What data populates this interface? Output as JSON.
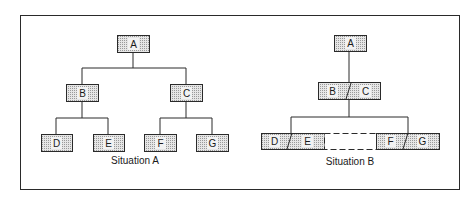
{
  "diagram": {
    "type": "org-chart-comparison",
    "colors": {
      "line": "#2a2a2a",
      "box_fill": "#cfcfcf",
      "label_bg": "#f2f2f2"
    },
    "situation_a": {
      "caption": "Situation A",
      "nodes": [
        {
          "id": "A",
          "label": "A"
        },
        {
          "id": "B",
          "label": "B"
        },
        {
          "id": "C",
          "label": "C"
        },
        {
          "id": "D",
          "label": "D"
        },
        {
          "id": "E",
          "label": "E"
        },
        {
          "id": "F",
          "label": "F"
        },
        {
          "id": "G",
          "label": "G"
        }
      ],
      "edges": [
        [
          "A",
          "B"
        ],
        [
          "A",
          "C"
        ],
        [
          "B",
          "D"
        ],
        [
          "B",
          "E"
        ],
        [
          "C",
          "F"
        ],
        [
          "C",
          "G"
        ]
      ]
    },
    "situation_b": {
      "caption": "Situation B",
      "nodes": [
        {
          "id": "A",
          "label": "A"
        },
        {
          "id": "BC",
          "labels": [
            "B",
            "C"
          ]
        },
        {
          "id": "DE",
          "labels": [
            "D",
            "E"
          ]
        },
        {
          "id": "gap",
          "labels": []
        },
        {
          "id": "FG",
          "labels": [
            "F",
            "G"
          ]
        }
      ],
      "edges": [
        [
          "A",
          "BC"
        ],
        [
          "BC",
          "DE"
        ],
        [
          "BC",
          "FG"
        ]
      ]
    }
  }
}
